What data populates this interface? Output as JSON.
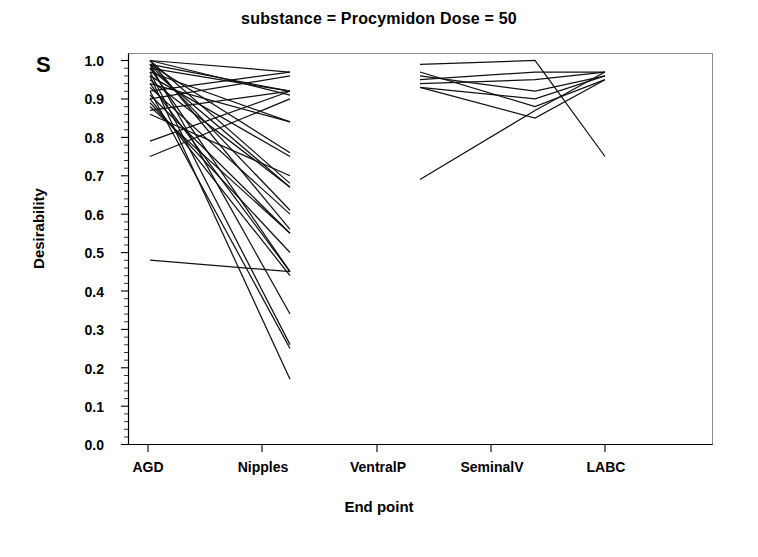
{
  "figure": {
    "title": "substance = Procymidon  Dose = 50",
    "corner_label": "S",
    "background_color": "#ffffff",
    "line_color": "#111111"
  },
  "chart_data": {
    "type": "line",
    "title": "substance = Procymidon  Dose = 50",
    "subtitle": "",
    "xlabel": "End point",
    "ylabel": "Desirability",
    "categories": [
      "AGD",
      "Nipples",
      "VentralP",
      "SeminalV",
      "LABC"
    ],
    "xtick_labels": [
      "AGD",
      "Nipples",
      "VentralP",
      "SeminalV",
      "LABC"
    ],
    "ytick_labels": [
      "1.0",
      "0.9",
      "0.8",
      "0.7",
      "0.6",
      "0.5",
      "0.4",
      "0.3",
      "0.2",
      "0.1",
      "0.0"
    ],
    "ytick_values": [
      1.0,
      0.9,
      0.8,
      0.7,
      0.6,
      0.5,
      0.4,
      0.3,
      0.2,
      0.1,
      0.0
    ],
    "ylim": [
      0.0,
      1.0
    ],
    "grid": false,
    "legend": "none",
    "minor_ticks": true,
    "series": [
      {
        "name": "profile-1",
        "group": "left",
        "x": [
          "AGD",
          "Nipples"
        ],
        "values": [
          1.0,
          0.97
        ]
      },
      {
        "name": "profile-2",
        "group": "left",
        "x": [
          "AGD",
          "Nipples"
        ],
        "values": [
          0.99,
          0.92
        ]
      },
      {
        "name": "profile-3",
        "group": "left",
        "x": [
          "AGD",
          "Nipples"
        ],
        "values": [
          0.98,
          0.92
        ]
      },
      {
        "name": "profile-4",
        "group": "left",
        "x": [
          "AGD",
          "Nipples"
        ],
        "values": [
          1.0,
          0.91
        ]
      },
      {
        "name": "profile-5",
        "group": "left",
        "x": [
          "AGD",
          "Nipples"
        ],
        "values": [
          0.92,
          0.97
        ]
      },
      {
        "name": "profile-6",
        "group": "left",
        "x": [
          "AGD",
          "Nipples"
        ],
        "values": [
          0.9,
          0.96
        ]
      },
      {
        "name": "profile-7",
        "group": "left",
        "x": [
          "AGD",
          "Nipples"
        ],
        "values": [
          0.97,
          0.84
        ]
      },
      {
        "name": "profile-8",
        "group": "left",
        "x": [
          "AGD",
          "Nipples"
        ],
        "values": [
          0.94,
          0.84
        ]
      },
      {
        "name": "profile-9",
        "group": "left",
        "x": [
          "AGD",
          "Nipples"
        ],
        "values": [
          0.87,
          0.92
        ]
      },
      {
        "name": "profile-10",
        "group": "left",
        "x": [
          "AGD",
          "Nipples"
        ],
        "values": [
          0.99,
          0.76
        ]
      },
      {
        "name": "profile-11",
        "group": "left",
        "x": [
          "AGD",
          "Nipples"
        ],
        "values": [
          0.96,
          0.75
        ]
      },
      {
        "name": "profile-12",
        "group": "left",
        "x": [
          "AGD",
          "Nipples"
        ],
        "values": [
          1.0,
          0.68
        ]
      },
      {
        "name": "profile-13",
        "group": "left",
        "x": [
          "AGD",
          "Nipples"
        ],
        "values": [
          0.98,
          0.67
        ]
      },
      {
        "name": "profile-14",
        "group": "left",
        "x": [
          "AGD",
          "Nipples"
        ],
        "values": [
          0.95,
          0.67
        ]
      },
      {
        "name": "profile-15",
        "group": "left",
        "x": [
          "AGD",
          "Nipples"
        ],
        "values": [
          0.79,
          0.92
        ]
      },
      {
        "name": "profile-16",
        "group": "left",
        "x": [
          "AGD",
          "Nipples"
        ],
        "values": [
          0.75,
          0.9
        ]
      },
      {
        "name": "profile-17",
        "group": "left",
        "x": [
          "AGD",
          "Nipples"
        ],
        "values": [
          0.99,
          0.61
        ]
      },
      {
        "name": "profile-18",
        "group": "left",
        "x": [
          "AGD",
          "Nipples"
        ],
        "values": [
          0.93,
          0.6
        ]
      },
      {
        "name": "profile-19",
        "group": "left",
        "x": [
          "AGD",
          "Nipples"
        ],
        "values": [
          1.0,
          0.56
        ]
      },
      {
        "name": "profile-20",
        "group": "left",
        "x": [
          "AGD",
          "Nipples"
        ],
        "values": [
          0.91,
          0.55
        ]
      },
      {
        "name": "profile-21",
        "group": "left",
        "x": [
          "AGD",
          "Nipples"
        ],
        "values": [
          0.88,
          0.55
        ]
      },
      {
        "name": "profile-22",
        "group": "left",
        "x": [
          "AGD",
          "Nipples"
        ],
        "values": [
          0.98,
          0.45
        ]
      },
      {
        "name": "profile-23",
        "group": "left",
        "x": [
          "AGD",
          "Nipples"
        ],
        "values": [
          0.94,
          0.45
        ]
      },
      {
        "name": "profile-24",
        "group": "left",
        "x": [
          "AGD",
          "Nipples"
        ],
        "values": [
          0.9,
          0.44
        ]
      },
      {
        "name": "profile-25",
        "group": "left",
        "x": [
          "AGD",
          "Nipples"
        ],
        "values": [
          0.48,
          0.45
        ]
      },
      {
        "name": "profile-26",
        "group": "left",
        "x": [
          "AGD",
          "Nipples"
        ],
        "values": [
          0.99,
          0.34
        ]
      },
      {
        "name": "profile-27",
        "group": "left",
        "x": [
          "AGD",
          "Nipples"
        ],
        "values": [
          0.97,
          0.26
        ]
      },
      {
        "name": "profile-28",
        "group": "left",
        "x": [
          "AGD",
          "Nipples"
        ],
        "values": [
          0.92,
          0.25
        ]
      },
      {
        "name": "profile-29",
        "group": "left",
        "x": [
          "AGD",
          "Nipples"
        ],
        "values": [
          0.96,
          0.17
        ]
      },
      {
        "name": "profile-30",
        "group": "left",
        "x": [
          "AGD",
          "Nipples"
        ],
        "values": [
          0.86,
          0.7
        ]
      },
      {
        "name": "profile-31",
        "group": "left",
        "x": [
          "AGD",
          "Nipples"
        ],
        "values": [
          0.89,
          0.5
        ]
      },
      {
        "name": "profile-32",
        "group": "right",
        "x": [
          "VentralP",
          "SeminalV",
          "LABC"
        ],
        "values": [
          0.99,
          1.0,
          0.75
        ]
      },
      {
        "name": "profile-33",
        "group": "right",
        "x": [
          "VentralP",
          "SeminalV",
          "LABC"
        ],
        "values": [
          0.95,
          0.97,
          0.97
        ]
      },
      {
        "name": "profile-34",
        "group": "right",
        "x": [
          "VentralP",
          "SeminalV",
          "LABC"
        ],
        "values": [
          0.94,
          0.95,
          0.97
        ]
      },
      {
        "name": "profile-35",
        "group": "right",
        "x": [
          "VentralP",
          "SeminalV",
          "LABC"
        ],
        "values": [
          0.96,
          0.92,
          0.96
        ]
      },
      {
        "name": "profile-36",
        "group": "right",
        "x": [
          "VentralP",
          "SeminalV",
          "LABC"
        ],
        "values": [
          0.93,
          0.9,
          0.96
        ]
      },
      {
        "name": "profile-37",
        "group": "right",
        "x": [
          "VentralP",
          "SeminalV",
          "LABC"
        ],
        "values": [
          0.97,
          0.88,
          0.95
        ]
      },
      {
        "name": "profile-38",
        "group": "right",
        "x": [
          "VentralP",
          "SeminalV",
          "LABC"
        ],
        "values": [
          0.93,
          0.85,
          0.95
        ]
      },
      {
        "name": "profile-39",
        "group": "right",
        "x": [
          "VentralP",
          "SeminalV",
          "LABC"
        ],
        "values": [
          0.69,
          0.87,
          0.97
        ]
      }
    ]
  }
}
